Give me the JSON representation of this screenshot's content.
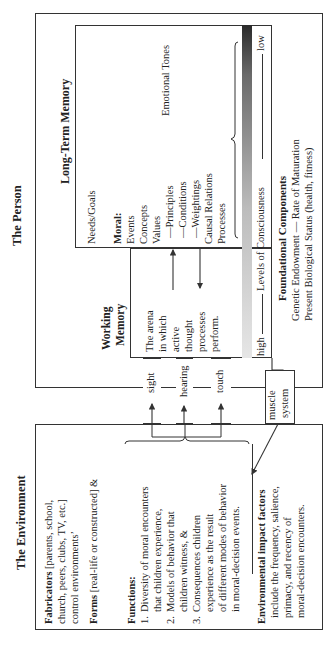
{
  "person": {
    "title": "The Person",
    "long_term_memory": {
      "title": "Long-Term Memory",
      "needs_goals": "Needs/Goals",
      "moral_label": "Moral:",
      "moral_items": [
        "Events",
        "Concepts",
        "Values",
        "—Principles",
        "—Conditions",
        "—Weightings",
        "Causal Relations",
        "Processes"
      ],
      "emotional_tones": "Emotional Tones"
    },
    "working_memory": {
      "title_line1": "Working",
      "title_line2": "Memory",
      "lines": [
        "The arena",
        "in which",
        "active",
        "thought",
        "processes",
        "perform."
      ]
    },
    "consciousness": {
      "high": "high",
      "label": "Levels of Consciousness",
      "low": "low"
    },
    "foundational": {
      "title": "Foundational Components",
      "line1": "Genetic Endowment — Rate of Maturation",
      "line2": "Present Biological Status (health, fitness)"
    }
  },
  "channels": {
    "sight": "sight",
    "hearing": "hearing",
    "touch": "touch",
    "muscle_line1": "muscle",
    "muscle_line2": "system"
  },
  "environment": {
    "title": "The Environment",
    "fabricators_bold": "Fabricators",
    "fabricators_lines": [
      " [parents, school,",
      "church, peers, clubs, TV, etc.]",
      "control environments’"
    ],
    "forms_bold": "Forms",
    "forms_rest": " [real-life or constructed] &",
    "functions_label": "Functions:",
    "functions": [
      [
        "1.",
        "Diversity of moral encounters",
        "that children experience,"
      ],
      [
        "2.",
        "Models of behavior that",
        "children witness, &"
      ],
      [
        "3.",
        "Consequences children",
        "experience as the result",
        "of different modes of behavior",
        "in moral-decision events."
      ]
    ],
    "impact_bold": "Environmental impact factors",
    "impact_lines": [
      "include the frequency, salience,",
      "primacy, and recency of",
      "moral-decision encounters."
    ]
  }
}
